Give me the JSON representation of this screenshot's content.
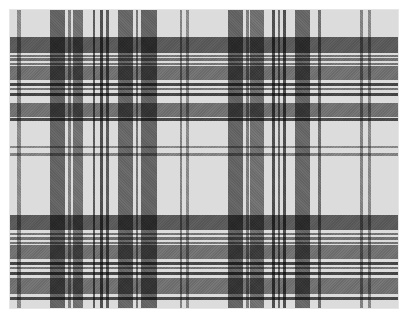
{
  "image": {
    "description": "Grayscale tartan plaid pattern",
    "ground_color": "#dcdcdc",
    "border_color": "#ffffff"
  },
  "vertical_stripes": [
    {
      "x": 7,
      "w": 4,
      "shade": "#a8a8a8"
    },
    {
      "x": 40,
      "w": 15,
      "shade": "#7a7a7a"
    },
    {
      "x": 58,
      "w": 3,
      "shade": "#9a9a9a"
    },
    {
      "x": 63,
      "w": 10,
      "shade": "#8a8a8a"
    },
    {
      "x": 83,
      "w": 2,
      "shade": "#707070"
    },
    {
      "x": 90,
      "w": 3,
      "shade": "#606060"
    },
    {
      "x": 96,
      "w": 3,
      "shade": "#707070"
    },
    {
      "x": 108,
      "w": 15,
      "shade": "#7e7e7e"
    },
    {
      "x": 126,
      "w": 2,
      "shade": "#909090"
    },
    {
      "x": 131,
      "w": 16,
      "shade": "#7a7a7a"
    },
    {
      "x": 170,
      "w": 2,
      "shade": "#a0a0a0"
    },
    {
      "x": 176,
      "w": 3,
      "shade": "#a8a8a8"
    },
    {
      "x": 218,
      "w": 15,
      "shade": "#7a7a7a"
    },
    {
      "x": 236,
      "w": 3,
      "shade": "#9a9a9a"
    },
    {
      "x": 240,
      "w": 14,
      "shade": "#8a8a8a"
    },
    {
      "x": 262,
      "w": 3,
      "shade": "#606060"
    },
    {
      "x": 268,
      "w": 2,
      "shade": "#808080"
    },
    {
      "x": 273,
      "w": 3,
      "shade": "#606060"
    },
    {
      "x": 285,
      "w": 15,
      "shade": "#7e7e7e"
    },
    {
      "x": 308,
      "w": 3,
      "shade": "#8a8a8a"
    },
    {
      "x": 350,
      "w": 3,
      "shade": "#a0a0a0"
    },
    {
      "x": 358,
      "w": 3,
      "shade": "#a8a8a8"
    }
  ],
  "horizontal_stripes": [
    {
      "y": 27,
      "h": 16,
      "shade": "#6e6e6e"
    },
    {
      "y": 45,
      "h": 2,
      "shade": "#909090"
    },
    {
      "y": 48,
      "h": 3,
      "shade": "#8a8a8a"
    },
    {
      "y": 53,
      "h": 2,
      "shade": "#909090"
    },
    {
      "y": 56,
      "h": 14,
      "shade": "#8a8a8a"
    },
    {
      "y": 73,
      "h": 3,
      "shade": "#555555"
    },
    {
      "y": 78,
      "h": 2,
      "shade": "#909090"
    },
    {
      "y": 83,
      "h": 3,
      "shade": "#555555"
    },
    {
      "y": 93,
      "h": 14,
      "shade": "#8a8a8a"
    },
    {
      "y": 108,
      "h": 3,
      "shade": "#5a5a5a"
    },
    {
      "y": 136,
      "h": 2,
      "shade": "#a8a8a8"
    },
    {
      "y": 143,
      "h": 3,
      "shade": "#a0a0a0"
    },
    {
      "y": 205,
      "h": 15,
      "shade": "#6e6e6e"
    },
    {
      "y": 223,
      "h": 2,
      "shade": "#909090"
    },
    {
      "y": 227,
      "h": 3,
      "shade": "#8a8a8a"
    },
    {
      "y": 232,
      "h": 2,
      "shade": "#909090"
    },
    {
      "y": 235,
      "h": 14,
      "shade": "#8a8a8a"
    },
    {
      "y": 252,
      "h": 3,
      "shade": "#555555"
    },
    {
      "y": 257,
      "h": 2,
      "shade": "#909090"
    },
    {
      "y": 262,
      "h": 3,
      "shade": "#555555"
    },
    {
      "y": 268,
      "h": 16,
      "shade": "#8a8a8a"
    },
    {
      "y": 287,
      "h": 3,
      "shade": "#5a5a5a"
    }
  ]
}
